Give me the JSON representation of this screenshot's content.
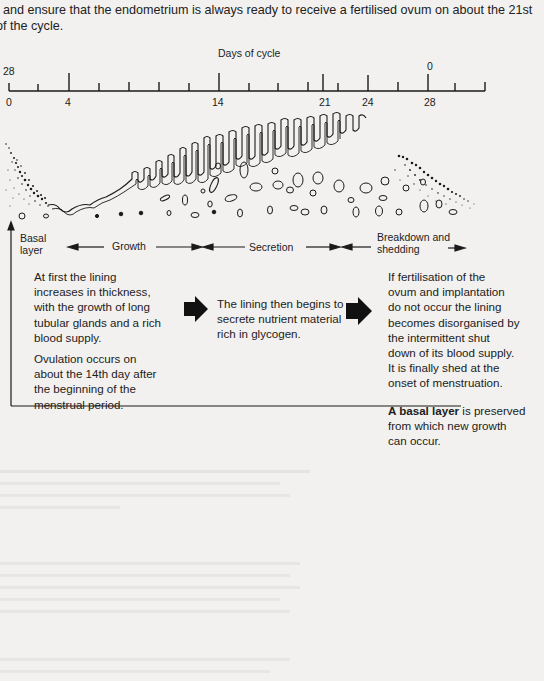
{
  "intro": {
    "line1": ", and ensure that the endometrium is always ready to receive a fertilised ovum on about the 21st",
    "line2": "of the cycle."
  },
  "timeline": {
    "title": "Days of cycle",
    "upper_labels": [
      {
        "text": "28",
        "x": 1
      },
      {
        "text": "0",
        "x": 427
      }
    ],
    "lower_labels": [
      {
        "text": "0",
        "x": 6
      },
      {
        "text": "4",
        "x": 65
      },
      {
        "text": "14",
        "x": 212
      },
      {
        "text": "21",
        "x": 320
      },
      {
        "text": "24",
        "x": 363
      },
      {
        "text": "28",
        "x": 425
      }
    ]
  },
  "diagram": {
    "left_label": {
      "line1": "Basal",
      "line2": "layer"
    },
    "phases": [
      {
        "name": "growth",
        "label": "Growth"
      },
      {
        "name": "secretion",
        "label": "Secretion"
      },
      {
        "name": "breakdown",
        "label_line1": "Breakdown and",
        "label_line2": "shedding"
      }
    ]
  },
  "descriptions": {
    "growth": {
      "para1": [
        "At first the lining",
        "increases in thickness,",
        "with the growth of long",
        "tubular glands and a rich",
        "blood supply."
      ],
      "para2": [
        "Ovulation occurs on",
        "about the 14th day after",
        "the beginning of the",
        "menstrual period."
      ]
    },
    "secretion": {
      "para1": [
        "The lining then begins to",
        "secrete nutrient material",
        "rich in glycogen."
      ]
    },
    "breakdown": {
      "para1": [
        "If fertilisation of the",
        "ovum and implantation",
        "do not occur the lining",
        "becomes disorganised by",
        "the intermittent shut",
        "down of its blood supply.",
        "It is finally shed at the",
        "onset of menstruation."
      ],
      "para2_bold": "A basal layer",
      "para2_rest_line1": " is preserved",
      "para2_rest": [
        "from which new growth",
        "can occur."
      ]
    }
  },
  "colors": {
    "ink": "#1a1a1a",
    "paper": "#f2f1ef",
    "bleed_through": "#d4d3d1"
  }
}
